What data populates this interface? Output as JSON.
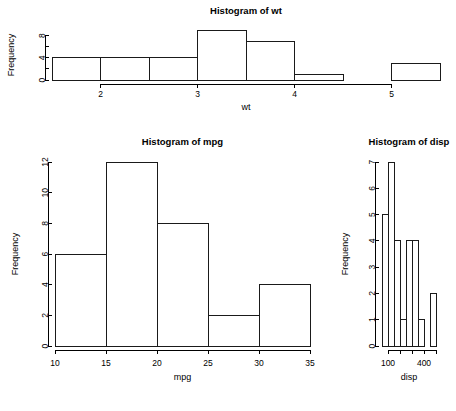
{
  "page": {
    "background": "#ffffff",
    "foreground": "#000000",
    "layout": "three histogram panels: wt across top, mpg bottom-left, disp bottom-right"
  },
  "chart_data": [
    {
      "id": "wt",
      "type": "bar",
      "title": "Histogram of wt",
      "xlabel": "wt",
      "ylabel": "Frequency",
      "bin_edges": [
        1.5,
        2.0,
        2.5,
        3.0,
        3.5,
        4.0,
        4.5,
        5.0,
        5.5
      ],
      "categories": [
        "1.5-2",
        "2-2.5",
        "2.5-3",
        "3-3.5",
        "3.5-4",
        "4-4.5",
        "4.5-5",
        "5-5.5"
      ],
      "values": [
        4,
        4,
        4,
        9,
        7,
        1,
        0,
        3
      ],
      "xlim": [
        1.5,
        5.5
      ],
      "ylim": [
        0,
        9
      ],
      "xticks": [
        2,
        3,
        4,
        5
      ],
      "xtick_labels": [
        "2",
        "3",
        "4",
        "5"
      ],
      "yticks": [
        0,
        2,
        4,
        6,
        8
      ],
      "ytick_labels": [
        "0",
        "",
        "4",
        "",
        "8"
      ],
      "grid": false,
      "legend": false
    },
    {
      "id": "mpg",
      "type": "bar",
      "title": "Histogram of mpg",
      "xlabel": "mpg",
      "ylabel": "Frequency",
      "bin_edges": [
        10,
        15,
        20,
        25,
        30,
        35
      ],
      "categories": [
        "10-15",
        "15-20",
        "20-25",
        "25-30",
        "30-35"
      ],
      "values": [
        6,
        12,
        8,
        2,
        4
      ],
      "xlim": [
        10,
        35
      ],
      "ylim": [
        0,
        12
      ],
      "xticks": [
        10,
        15,
        20,
        25,
        30,
        35
      ],
      "xtick_labels": [
        "10",
        "15",
        "20",
        "25",
        "30",
        "35"
      ],
      "yticks": [
        0,
        2,
        4,
        6,
        8,
        10,
        12
      ],
      "ytick_labels": [
        "0",
        "2",
        "4",
        "6",
        "8",
        "10",
        "12"
      ],
      "grid": false,
      "legend": false
    },
    {
      "id": "disp",
      "type": "bar",
      "title": "Histogram of disp",
      "xlabel": "disp",
      "ylabel": "Frequency",
      "bin_edges": [
        50,
        100,
        150,
        200,
        250,
        300,
        350,
        400,
        450,
        500
      ],
      "categories": [
        "50-100",
        "100-150",
        "150-200",
        "200-250",
        "250-300",
        "300-350",
        "350-400",
        "400-450",
        "450-500"
      ],
      "values": [
        5,
        7,
        4,
        1,
        4,
        4,
        1,
        0,
        2
      ],
      "xlim": [
        50,
        500
      ],
      "ylim": [
        0,
        7
      ],
      "xticks": [
        100,
        200,
        300,
        400,
        500
      ],
      "xtick_labels": [
        "100",
        "",
        "",
        "400",
        ""
      ],
      "yticks": [
        0,
        1,
        2,
        3,
        4,
        5,
        6,
        7
      ],
      "ytick_labels": [
        "0",
        "1",
        "2",
        "3",
        "4",
        "5",
        "6",
        "7"
      ],
      "grid": false,
      "legend": false
    }
  ]
}
